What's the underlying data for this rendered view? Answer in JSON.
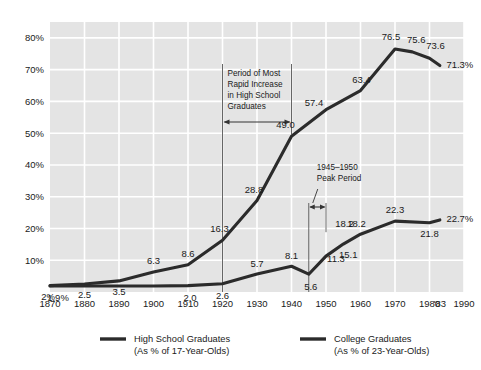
{
  "chart_data": {
    "type": "line",
    "title": "",
    "xlabel": "",
    "ylabel": "",
    "xlim": [
      1870,
      1990
    ],
    "ylim": [
      0,
      85
    ],
    "grid": true,
    "legend_position": "bottom",
    "x_ticks": [
      "1870",
      "1880",
      "1890",
      "1900",
      "1910",
      "1920",
      "1930",
      "1940",
      "1950",
      "1960",
      "1970",
      "1980",
      "'83",
      "1990"
    ],
    "x_tick_values": [
      1870,
      1880,
      1890,
      1900,
      1910,
      1920,
      1930,
      1940,
      1950,
      1960,
      1970,
      1980,
      1983,
      1990
    ],
    "y_ticks": [
      "10%",
      "20%",
      "30%",
      "40%",
      "50%",
      "60%",
      "70%",
      "80%"
    ],
    "y_tick_values": [
      10,
      20,
      30,
      40,
      50,
      60,
      70,
      80
    ],
    "series": [
      {
        "name": "High School Graduates",
        "sublabel": "(As % of 17-Year-Olds)",
        "color": "#2b2b2b",
        "x": [
          1870,
          1880,
          1890,
          1900,
          1910,
          1920,
          1930,
          1940,
          1950,
          1960,
          1970,
          1975,
          1980,
          1983
        ],
        "values": [
          2.0,
          2.5,
          3.5,
          6.3,
          8.6,
          16.3,
          28.8,
          49.0,
          57.4,
          63.4,
          76.5,
          75.6,
          73.6,
          71.3
        ],
        "labels": [
          "2%",
          "2.5",
          "3.5",
          "6.3",
          "8.6",
          "16.3",
          "28.8",
          "49.0",
          "57.4",
          "63.4",
          "76.5",
          "75.6",
          "73.6",
          "71.3%"
        ]
      },
      {
        "name": "College Graduates",
        "sublabel": "(As % of 23-Year-Olds)",
        "color": "#2b2b2b",
        "x": [
          1870,
          1900,
          1910,
          1920,
          1930,
          1940,
          1945,
          1950,
          1955,
          1960,
          1970,
          1980,
          1983
        ],
        "values": [
          1.9,
          1.9,
          2.0,
          2.6,
          5.7,
          8.1,
          5.6,
          11.3,
          15.1,
          18.2,
          22.3,
          21.8,
          22.7
        ],
        "labels": [
          "1.9%",
          "",
          "2.0",
          "2.6",
          "5.7",
          "8.1",
          "5.6",
          "11.3",
          "15.1",
          "18.2",
          "22.3",
          "21.8",
          "22.7%"
        ]
      }
    ],
    "annotations": [
      {
        "id": "rapid-increase",
        "lines": [
          "Period of Most",
          "Rapid Increase",
          "in High School",
          "Graduates"
        ],
        "from_year": 1920,
        "to_year": 1940
      },
      {
        "id": "peak-period",
        "lines": [
          "1945–1950",
          "Peak Period"
        ],
        "from_year": 1945,
        "to_year": 1950
      }
    ],
    "extra_labels": [
      {
        "text": "18.2",
        "year": 1960,
        "value": 18.2
      }
    ]
  },
  "colors": {
    "plot_background": "#e4e4e4",
    "gridline": "#ffffff",
    "line": "#2b2b2b",
    "text": "#1a1a1a"
  },
  "legend": {
    "items": [
      {
        "label": "High School Graduates",
        "sublabel": "(As % of 17-Year-Olds)"
      },
      {
        "label": "College Graduates",
        "sublabel": "(As % of 23-Year-Olds)"
      }
    ]
  }
}
